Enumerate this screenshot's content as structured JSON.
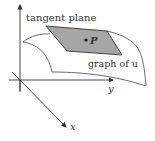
{
  "diagram": {
    "labels": {
      "tangent_plane": "tangent plane",
      "point": "P",
      "graph": "graph of u",
      "y_axis": "y",
      "x_axis": "x"
    },
    "colors": {
      "plane_fill": "#a6a6a6",
      "stroke": "#333333",
      "background": "#ffffff"
    }
  }
}
